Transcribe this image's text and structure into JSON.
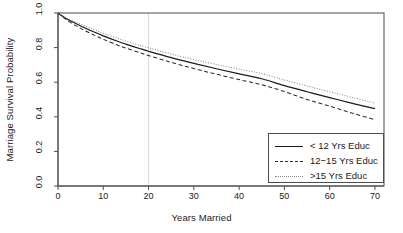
{
  "chart_data": {
    "type": "line",
    "title": "",
    "xlabel": "Years Married",
    "ylabel": "Marriage Survival Probability",
    "xlim": [
      0,
      72
    ],
    "ylim": [
      0.0,
      1.0
    ],
    "grid": false,
    "legend_position": "bottom-right",
    "xticks": [
      0,
      10,
      20,
      30,
      40,
      50,
      60,
      70
    ],
    "xtick_labels": [
      "0",
      "10",
      "20",
      "30",
      "40",
      "50",
      "60",
      "70"
    ],
    "yticks": [
      0.0,
      0.2,
      0.4,
      0.6,
      0.8,
      1.0
    ],
    "ytick_labels": [
      "0.0",
      "0.2",
      "0.4",
      "0.6",
      "0.8",
      "1.0"
    ],
    "annotations": [
      {
        "name": "reference-line",
        "type": "vline",
        "x": 20,
        "color": "#d9d9d9"
      }
    ],
    "x": [
      0,
      2,
      5,
      8,
      10,
      13,
      15,
      18,
      20,
      25,
      30,
      35,
      40,
      45,
      50,
      55,
      60,
      65,
      70
    ],
    "series": [
      {
        "name": "< 12 Yrs Educ",
        "style": "solid",
        "color": "#1a1a1a",
        "values": [
          1.0,
          0.965,
          0.925,
          0.89,
          0.868,
          0.838,
          0.82,
          0.795,
          0.779,
          0.742,
          0.709,
          0.678,
          0.648,
          0.62,
          0.58,
          0.545,
          0.511,
          0.478,
          0.447
        ]
      },
      {
        "name": "12-15 Yrs Educ",
        "style": "dashed",
        "color": "#2b2b2b",
        "values": [
          1.0,
          0.958,
          0.911,
          0.872,
          0.848,
          0.816,
          0.797,
          0.771,
          0.754,
          0.715,
          0.679,
          0.646,
          0.615,
          0.585,
          0.546,
          0.5,
          0.462,
          0.421,
          0.383
        ]
      },
      {
        "name": ">15 Yrs Educ",
        "style": "dotted",
        "color": "#8a8a8a",
        "values": [
          1.0,
          0.97,
          0.935,
          0.903,
          0.883,
          0.855,
          0.838,
          0.814,
          0.799,
          0.763,
          0.731,
          0.702,
          0.675,
          0.65,
          0.613,
          0.578,
          0.545,
          0.512,
          0.479
        ]
      }
    ]
  },
  "legend": {
    "items": [
      {
        "label": "< 12 Yrs Educ"
      },
      {
        "label": "12−15 Yrs Educ"
      },
      {
        "label": ">15 Yrs Educ"
      }
    ]
  }
}
